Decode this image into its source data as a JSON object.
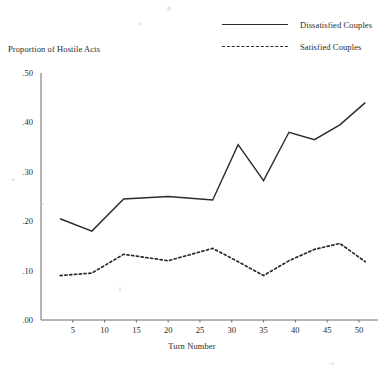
{
  "chart_data": {
    "type": "line",
    "title": "",
    "xlabel": "Turn Number",
    "ylabel": "Proportion of Hostile Acts",
    "xlim": [
      0,
      53
    ],
    "ylim": [
      0.0,
      0.5
    ],
    "grid": false,
    "legend_position": "top-right",
    "xticks": [
      5,
      10,
      15,
      20,
      25,
      30,
      35,
      40,
      45,
      50
    ],
    "xtick_labels": [
      "5",
      "10",
      "15",
      "20",
      "25",
      "30",
      "35",
      "40",
      "45",
      "50"
    ],
    "yticks": [
      0.0,
      0.1,
      0.2,
      0.3,
      0.4,
      0.5
    ],
    "ytick_labels": [
      ".00",
      ".10",
      ".20",
      ".30",
      ".40",
      ".50"
    ],
    "x": [
      3,
      8,
      13,
      20,
      27,
      31,
      35,
      39,
      43,
      47,
      51
    ],
    "series": [
      {
        "name": "Dissatisfied Couples",
        "style": "solid",
        "values": [
          0.205,
          0.18,
          0.245,
          0.25,
          0.243,
          0.355,
          0.282,
          0.38,
          0.365,
          0.395,
          0.44
        ]
      },
      {
        "name": "Satisfied Couples",
        "style": "dotted",
        "values": [
          0.09,
          0.095,
          0.133,
          0.12,
          0.145,
          0.118,
          0.09,
          0.12,
          0.143,
          0.155,
          0.118
        ]
      }
    ]
  },
  "legend": {
    "items": [
      {
        "label": "Dissatisfied Couples",
        "style": "solid"
      },
      {
        "label": "Satisfied Couples",
        "style": "dotted"
      }
    ]
  },
  "axes": {
    "y_title": "Proportion of Hostile Acts",
    "x_title": "Turn Number",
    "y_ticks": [
      ".50",
      ".40",
      ".30",
      ".20",
      ".10",
      ".00"
    ],
    "x_ticks": [
      "5",
      "10",
      "15",
      "20",
      "25",
      "30",
      "35",
      "40",
      "45",
      "50"
    ]
  }
}
